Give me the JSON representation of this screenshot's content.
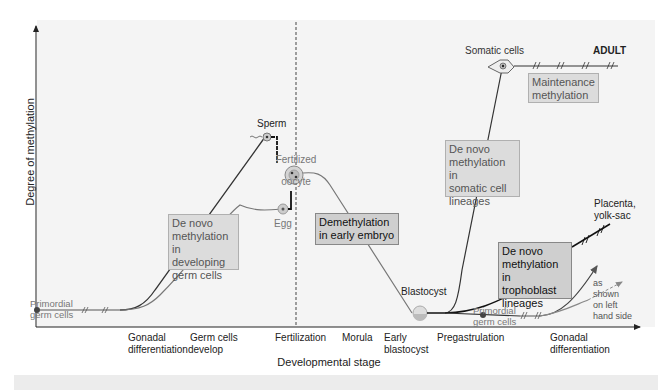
{
  "axes": {
    "y_label": "Degree of methylation",
    "x_label": "Developmental stage"
  },
  "x_ticks": [
    {
      "line1": "Gonadal",
      "line2": "differentiation"
    },
    {
      "line1": "Germ cells",
      "line2": "develop"
    },
    {
      "line1": "Fertilization",
      "line2": ""
    },
    {
      "line1": "Morula",
      "line2": ""
    },
    {
      "line1": "Early",
      "line2": "blastocyst"
    },
    {
      "line1": "Pregastrulation",
      "line2": ""
    },
    {
      "line1": "Gonadal",
      "line2": "differentiation"
    }
  ],
  "cell_labels": {
    "primordial_left_1": "Primordial",
    "primordial_left_2": "germ cells",
    "sperm": "Sperm",
    "fertilized_1": "Fertilized",
    "fertilized_2": "oocyte",
    "egg": "Egg",
    "blastocyst": "Blastocyst",
    "somatic": "Somatic cells",
    "adult": "ADULT",
    "placenta_1": "Placenta,",
    "placenta_2": "yolk-sac",
    "primordial_right_1": "Primordial",
    "primordial_right_2": "germ cells",
    "as_shown_1": "as",
    "as_shown_2": "shown",
    "as_shown_3": "on left",
    "as_shown_4": "hand side"
  },
  "boxes": {
    "germ_denovo": [
      "De novo",
      "methylation",
      "in developing",
      "germ cells"
    ],
    "demethylation": [
      "Demethylation",
      "in early embryo"
    ],
    "somatic_denovo": [
      "De novo",
      "methylation in",
      "somatic cell",
      "lineages"
    ],
    "maintenance": [
      "Maintenance",
      "methylation"
    ],
    "trophoblast_denovo": [
      "De novo",
      "methylation in",
      "trophoblast",
      "lineages"
    ]
  },
  "colors": {
    "plot_bg": "#f4f4f4",
    "box_fill": "#dcdcdc",
    "line_dark": "#333333",
    "line_gray": "#777777"
  }
}
